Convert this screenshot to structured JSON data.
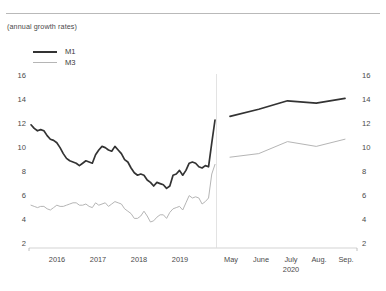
{
  "subtitle": "(annual growth rates)",
  "legend": {
    "position": "top-left",
    "items": [
      {
        "label": "M1",
        "color": "#333333",
        "width": 2.1,
        "name": "legend-item-m1"
      },
      {
        "label": "M3",
        "color": "#b5b5b5",
        "width": 1.1,
        "name": "legend-item-m3"
      }
    ]
  },
  "axes": {
    "y_left_ticks": [
      "16",
      "14",
      "12",
      "10",
      "8",
      "6",
      "4",
      "2"
    ],
    "y_right_ticks": [
      "16",
      "14",
      "12",
      "10",
      "8",
      "6",
      "4",
      "2"
    ],
    "ylim": [
      2,
      16
    ],
    "grid": false
  },
  "panels": [
    {
      "name": "left-panel",
      "x_ticks": [
        "2016",
        "2017",
        "2018",
        "2019"
      ],
      "x_sub": ""
    },
    {
      "name": "right-panel",
      "x_ticks": [
        "May",
        "June",
        "July",
        "Aug.",
        "Sep."
      ],
      "x_sub": "2020"
    }
  ],
  "chart_data": {
    "type": "line",
    "title": "",
    "subtitle": "(annual growth rates)",
    "xlabel": "",
    "ylabel": "",
    "ylim": [
      2,
      16
    ],
    "yticks": [
      2,
      4,
      6,
      8,
      10,
      12,
      14,
      16
    ],
    "grid": false,
    "legend_position": "top-left",
    "panels": [
      {
        "name": "2015-2020 monthly",
        "x": [
          "2015-07",
          "2015-08",
          "2015-09",
          "2015-10",
          "2015-11",
          "2015-12",
          "2016-01",
          "2016-02",
          "2016-03",
          "2016-04",
          "2016-05",
          "2016-06",
          "2016-07",
          "2016-08",
          "2016-09",
          "2016-10",
          "2016-11",
          "2016-12",
          "2017-01",
          "2017-02",
          "2017-03",
          "2017-04",
          "2017-05",
          "2017-06",
          "2017-07",
          "2017-08",
          "2017-09",
          "2017-10",
          "2017-11",
          "2017-12",
          "2018-01",
          "2018-02",
          "2018-03",
          "2018-04",
          "2018-05",
          "2018-06",
          "2018-07",
          "2018-08",
          "2018-09",
          "2018-10",
          "2018-11",
          "2018-12",
          "2019-01",
          "2019-02",
          "2019-03",
          "2019-04",
          "2019-05",
          "2019-06",
          "2019-07",
          "2019-08",
          "2019-09",
          "2019-10",
          "2019-11",
          "2019-12",
          "2020-01",
          "2020-02",
          "2020-03",
          "2020-04"
        ],
        "xticks": [
          "2016",
          "2017",
          "2018",
          "2019"
        ],
        "series": [
          {
            "name": "M1",
            "color": "#333333",
            "values": [
              11.6,
              11.3,
              11.1,
              11.2,
              11.1,
              10.7,
              10.4,
              10.3,
              10.1,
              9.7,
              9.2,
              8.8,
              8.6,
              8.5,
              8.4,
              8.2,
              8.4,
              8.6,
              8.5,
              8.4,
              9.1,
              9.5,
              9.8,
              9.7,
              9.5,
              9.4,
              9.8,
              9.5,
              9.2,
              8.7,
              8.5,
              8.0,
              7.6,
              7.4,
              7.5,
              7.4,
              7.0,
              6.8,
              6.5,
              6.8,
              6.7,
              6.6,
              6.3,
              6.5,
              7.4,
              7.5,
              7.8,
              7.4,
              7.8,
              8.4,
              8.5,
              8.4,
              8.1,
              8.0,
              8.2,
              8.1,
              10.1,
              12.0
            ]
          },
          {
            "name": "M3",
            "color": "#b5b5b5",
            "values": [
              4.9,
              4.8,
              4.7,
              4.8,
              4.8,
              4.6,
              4.5,
              4.7,
              4.9,
              4.8,
              4.8,
              4.9,
              5.0,
              5.1,
              5.1,
              4.9,
              4.9,
              5.0,
              4.8,
              4.7,
              5.1,
              4.9,
              5.0,
              5.1,
              4.8,
              5.0,
              5.2,
              5.1,
              5.0,
              4.6,
              4.4,
              4.2,
              3.8,
              3.8,
              4.0,
              4.4,
              4.0,
              3.5,
              3.6,
              3.9,
              4.1,
              4.1,
              3.8,
              4.3,
              4.6,
              4.7,
              4.8,
              4.5,
              5.1,
              5.7,
              5.5,
              5.6,
              5.5,
              5.0,
              5.2,
              5.5,
              7.5,
              8.3
            ]
          }
        ]
      },
      {
        "name": "2020 monthly",
        "x": [
          "2020-05",
          "2020-06",
          "2020-07",
          "2020-08",
          "2020-09"
        ],
        "xticks": [
          "May",
          "June",
          "July",
          "Aug.",
          "Sep."
        ],
        "xtick_sub": "2020",
        "series": [
          {
            "name": "M1",
            "color": "#333333",
            "values": [
              12.3,
              12.9,
              13.6,
              13.4,
              13.8
            ]
          },
          {
            "name": "M3",
            "color": "#b5b5b5",
            "values": [
              8.9,
              9.2,
              10.2,
              9.8,
              10.4
            ]
          }
        ]
      }
    ]
  }
}
